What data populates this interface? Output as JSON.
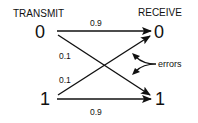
{
  "diagram": {
    "title_left": "TRANSMIT",
    "title_right": "RECEIVE",
    "transmit_nodes": [
      "0",
      "1"
    ],
    "receive_nodes": [
      "0",
      "1"
    ],
    "edges": [
      {
        "from": "0",
        "to": "0",
        "prob": "0.9",
        "type": "correct"
      },
      {
        "from": "0",
        "to": "1",
        "prob": "0.1",
        "type": "error"
      },
      {
        "from": "1",
        "to": "0",
        "prob": "0.1",
        "type": "error"
      },
      {
        "from": "1",
        "to": "1",
        "prob": "0.9",
        "type": "correct"
      }
    ],
    "annotation": "errors",
    "line_color": "#111111"
  }
}
